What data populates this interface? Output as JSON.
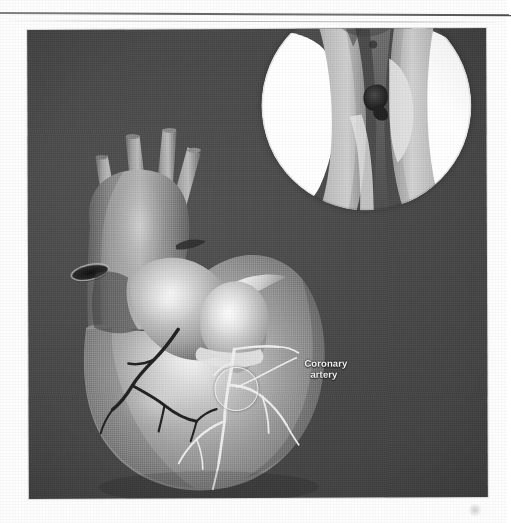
{
  "document": {
    "type": "scanned-figure",
    "page_background": "#fdfdfd",
    "has_top_rule": true,
    "rule_color": "#4b4b4b"
  },
  "figure": {
    "name": "heart-coronary-artery-figure",
    "panel": {
      "background_color": "#4a4a4a",
      "x": 28,
      "y": 29,
      "width": 459,
      "height": 469
    },
    "annotations": [
      {
        "id": "coronary-artery",
        "label_line1": "Coronary",
        "label_line2": "artery",
        "text_color": "#f3f3f3",
        "has_leader_line": true,
        "has_callout_ring": true
      }
    ],
    "inset": {
      "name": "artery-cross-section-inset",
      "shape": "circle",
      "diameter": 210,
      "shows_plaque": true,
      "lumen_color": "#ffffff",
      "vessel_wall_color": "#b9b9b9",
      "plaque_color": "#3a3a3a"
    },
    "structures": [
      {
        "id": "aorta",
        "label": "Aorta",
        "tone": "#8d8d8d"
      },
      {
        "id": "aortic-branches",
        "label": "Aortic arch branches",
        "tone": "#9a9a9a"
      },
      {
        "id": "pulmonary-trunk",
        "label": "Pulmonary trunk",
        "tone": "#c2c2c2"
      },
      {
        "id": "superior-vena-cava",
        "label": "Superior vena cava",
        "tone": "#7e7e7e"
      },
      {
        "id": "right-ventricle",
        "label": "Right ventricle",
        "tone": "#a8a8a8"
      },
      {
        "id": "left-ventricle",
        "label": "Left ventricle",
        "tone": "#9c9c9c"
      },
      {
        "id": "coronary-arteries",
        "label": "Coronary arteries",
        "tone": "#f0f0f0"
      },
      {
        "id": "cardiac-veins",
        "label": "Cardiac veins",
        "tone": "#2b2b2b"
      }
    ],
    "colors": {
      "panel_dark": "#4a4a4a",
      "tissue_mid": "#9e9e9e",
      "tissue_light": "#d8d8d8",
      "highlight": "#f2f2f2",
      "vein_dark": "#262626"
    }
  }
}
